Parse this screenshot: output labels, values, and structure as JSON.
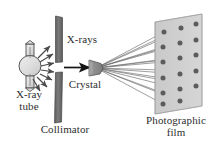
{
  "figure": {
    "background_color": "#ffffff",
    "ink_color": "#2e2e2e"
  },
  "labels": {
    "xrays": "X-rays",
    "crystal": "Crystal",
    "xray_tube": "X-ray\ntube",
    "collimator": "Collimator",
    "photographic_film": "Photographic\nfilm"
  },
  "components": {
    "xray_tube": {
      "name": "X-ray tube",
      "shape": "bulb",
      "fill_color": "#d9d9d9",
      "stroke_color": "#4a4a4a",
      "center": [
        30,
        66
      ],
      "emission_arrows": 7
    },
    "collimator": {
      "name": "Collimator",
      "fill_color": "#6e6e6e",
      "stroke_color": "#4a4a4a",
      "bars": 2,
      "slit_gap_y": [
        62,
        72
      ],
      "top_bar": [
        54,
        16,
        62,
        62
      ],
      "bottom_bar": [
        54,
        72,
        61,
        123
      ]
    },
    "beam": {
      "name": "Incident X-ray beam",
      "color": "#1c1c1c",
      "from": [
        64,
        67
      ],
      "to": [
        88,
        67
      ],
      "arrowhead": true
    },
    "crystal": {
      "name": "Crystal",
      "fill_color": "#8f8f8f",
      "stroke_color": "#5a5a5a",
      "center": [
        95,
        68
      ],
      "shape": "pentagon"
    },
    "photographic_film": {
      "name": "Photographic film",
      "fill_color": "#cfcfcf",
      "stroke_color": "#8a8a8a",
      "shape": "parallelogram",
      "corners": [
        [
          155,
          22
        ],
        [
          202,
          14
        ],
        [
          202,
          106
        ],
        [
          155,
          114
        ]
      ]
    }
  },
  "chart_data": {
    "type": "scatter",
    "xlabel": "",
    "ylabel": "",
    "spot_color": "#5c5c5c",
    "ray_color": "#6b6b6b",
    "ray_origin": [
      96,
      68
    ],
    "spots": [
      {
        "id": 1,
        "x": 164,
        "y": 32
      },
      {
        "id": 2,
        "x": 181,
        "y": 28
      },
      {
        "id": 3,
        "x": 196,
        "y": 24
      },
      {
        "id": 4,
        "x": 163,
        "y": 47
      },
      {
        "id": 5,
        "x": 180,
        "y": 43
      },
      {
        "id": 6,
        "x": 196,
        "y": 40
      },
      {
        "id": 7,
        "x": 163,
        "y": 62
      },
      {
        "id": 8,
        "x": 180,
        "y": 58
      },
      {
        "id": 9,
        "x": 196,
        "y": 55
      },
      {
        "id": 10,
        "x": 163,
        "y": 78
      },
      {
        "id": 11,
        "x": 180,
        "y": 74
      },
      {
        "id": 12,
        "x": 196,
        "y": 71
      },
      {
        "id": 13,
        "x": 163,
        "y": 93
      },
      {
        "id": 14,
        "x": 180,
        "y": 89
      },
      {
        "id": 15,
        "x": 196,
        "y": 86
      },
      {
        "id": 16,
        "x": 163,
        "y": 104
      },
      {
        "id": 17,
        "x": 180,
        "y": 101
      }
    ],
    "spot_count": 17,
    "grid": false,
    "legend": "none"
  }
}
